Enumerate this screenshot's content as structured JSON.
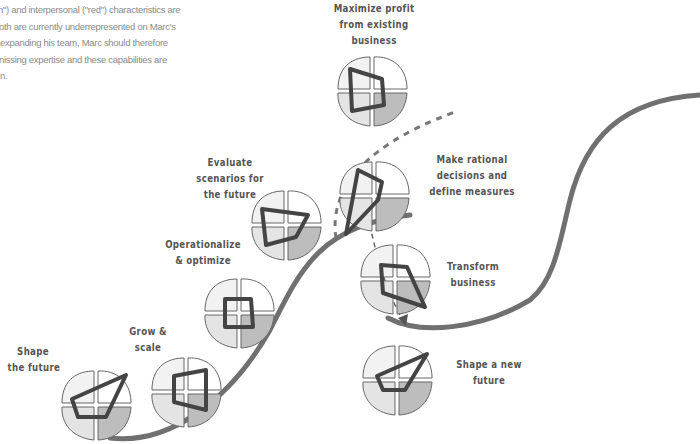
{
  "intro_text": {
    "lines": [
      "n\") and interpersonal (\"red\") characteristics are",
      "oth are currently underrepresented on Marc's",
      " expanding his team, Marc should therefore",
      "nissing expertise and these capabilities are",
      "n."
    ]
  },
  "colors": {
    "curve": "#707070",
    "outline": "#444444",
    "quad_light": "#f2f2f2",
    "quad_mid": "#e0e0e0",
    "quad_dark": "#bdbdbd",
    "label": "#555555",
    "body_text": "#8a8a8a"
  },
  "stages": [
    {
      "id": "shape-the-future",
      "label_lines": [
        "Shape",
        "the future"
      ]
    },
    {
      "id": "grow-and-scale",
      "label_lines": [
        "Grow &",
        "scale"
      ]
    },
    {
      "id": "operationalize-optimize",
      "label_lines": [
        "Operationalize",
        "& optimize"
      ]
    },
    {
      "id": "evaluate-scenarios",
      "label_lines": [
        "Evaluate",
        "scenarios for",
        "the future"
      ]
    },
    {
      "id": "maximize-profit",
      "label_lines": [
        "Maximize profit",
        "from existing",
        "business"
      ]
    },
    {
      "id": "make-rational-decisions",
      "label_lines": [
        "Make rational",
        "decisions and",
        "define measures"
      ]
    },
    {
      "id": "transform-business",
      "label_lines": [
        "Transform",
        "business"
      ]
    },
    {
      "id": "shape-a-new-future",
      "label_lines": [
        "Shape a new",
        "future"
      ]
    }
  ]
}
